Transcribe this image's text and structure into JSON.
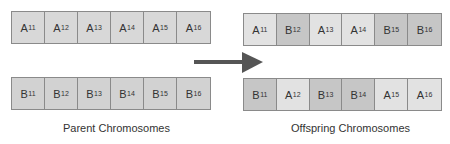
{
  "diagram": {
    "parent_label": "Parent Chromosomes",
    "offspring_label": "Offspring Chromosomes",
    "arrow": "right-arrow",
    "colors": {
      "parent_a": "#d8d8d8",
      "parent_b": "#d2d2d2",
      "offspring_a": "#e2e2e2",
      "offspring_b": "#c6c6c6",
      "arrow": "#555555"
    },
    "parents": [
      {
        "genes": [
          {
            "letter": "A",
            "index": "11"
          },
          {
            "letter": "A",
            "index": "12"
          },
          {
            "letter": "A",
            "index": "13"
          },
          {
            "letter": "A",
            "index": "14"
          },
          {
            "letter": "A",
            "index": "15"
          },
          {
            "letter": "A",
            "index": "16"
          }
        ]
      },
      {
        "genes": [
          {
            "letter": "B",
            "index": "11"
          },
          {
            "letter": "B",
            "index": "12"
          },
          {
            "letter": "B",
            "index": "13"
          },
          {
            "letter": "B",
            "index": "14"
          },
          {
            "letter": "B",
            "index": "15"
          },
          {
            "letter": "B",
            "index": "16"
          }
        ]
      }
    ],
    "offspring": [
      {
        "genes": [
          {
            "letter": "A",
            "index": "11"
          },
          {
            "letter": "B",
            "index": "12"
          },
          {
            "letter": "A",
            "index": "13"
          },
          {
            "letter": "A",
            "index": "14"
          },
          {
            "letter": "B",
            "index": "15"
          },
          {
            "letter": "B",
            "index": "16"
          }
        ]
      },
      {
        "genes": [
          {
            "letter": "B",
            "index": "11"
          },
          {
            "letter": "A",
            "index": "12"
          },
          {
            "letter": "B",
            "index": "13"
          },
          {
            "letter": "B",
            "index": "14"
          },
          {
            "letter": "A",
            "index": "15"
          },
          {
            "letter": "A",
            "index": "16"
          }
        ]
      }
    ]
  }
}
